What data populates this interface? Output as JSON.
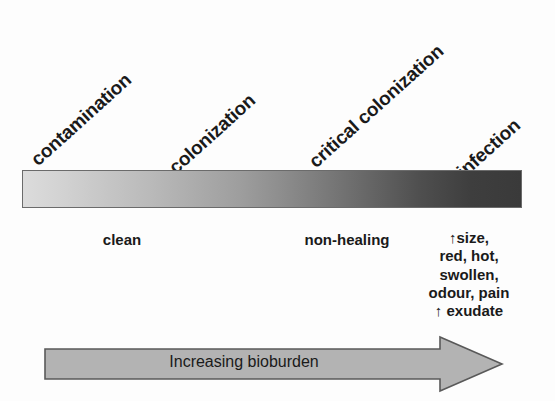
{
  "figure": {
    "stages": [
      {
        "id": "contamination",
        "label": "contamination"
      },
      {
        "id": "colonization",
        "label": "colonization"
      },
      {
        "id": "critical-colonization",
        "label": "critical colonization"
      },
      {
        "id": "infection",
        "label": "infection"
      }
    ],
    "descriptors": [
      {
        "id": "clean",
        "label": "clean"
      },
      {
        "id": "non-healing",
        "label": "non-healing"
      }
    ],
    "infection_signs": [
      "↑size,",
      "red, hot,",
      "swollen,",
      "odour, pain",
      "↑ exudate"
    ],
    "arrow": {
      "label": "Increasing bioburden",
      "direction": "right",
      "fill_color": "#b3b3b3",
      "stroke_color": "#595959"
    },
    "gradient": {
      "type": "linear",
      "direction": "left-to-right",
      "start_color": "#dcdcdc",
      "mid_color": "#8d8d8d",
      "end_color": "#3a3a3a",
      "border_color": "#6b6b6b"
    },
    "text_color": "#1a1a1a",
    "background_color": "#fdfdfd",
    "label_rotation_deg": -42
  }
}
